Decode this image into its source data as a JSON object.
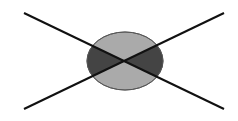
{
  "diagram": {
    "colors": {
      "background": "#ffffff",
      "ellipse_fill": "#aaaaaa",
      "ellipse_stroke": "#666666",
      "wedge_fill": "#444444",
      "line_stroke": "#111111"
    },
    "ellipse": {
      "cx": 125,
      "cy": 61,
      "rx": 38,
      "ry": 29
    },
    "lines": [
      {
        "x1": 24,
        "y1": 13,
        "x2": 224,
        "y2": 109
      },
      {
        "x1": 24,
        "y1": 109,
        "x2": 224,
        "y2": 13
      }
    ]
  }
}
